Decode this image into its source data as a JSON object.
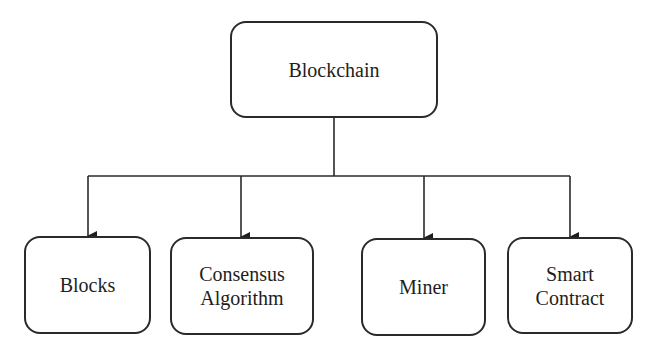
{
  "diagram": {
    "type": "hierarchy",
    "root": {
      "label": "Blockchain"
    },
    "children": [
      {
        "label": "Blocks"
      },
      {
        "label": "Consensus\nAlgorithm"
      },
      {
        "label": "Miner"
      },
      {
        "label": "Smart\nContract"
      }
    ],
    "edges": [
      {
        "from": "Blockchain",
        "to": "Blocks"
      },
      {
        "from": "Blockchain",
        "to": "Consensus Algorithm"
      },
      {
        "from": "Blockchain",
        "to": "Miner"
      },
      {
        "from": "Blockchain",
        "to": "Smart Contract"
      }
    ]
  }
}
